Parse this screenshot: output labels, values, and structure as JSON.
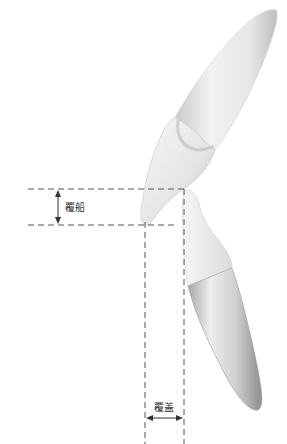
{
  "diagram": {
    "labels": {
      "overbite": "覆船",
      "overjet": "覆盖"
    },
    "colors": {
      "line": "#555555",
      "tooth_light": "#f4f4f4",
      "tooth_mid": "#d6d6d6",
      "tooth_dark": "#9a9a9a",
      "background": "#ffffff"
    },
    "elements": [
      "upper-incisor",
      "lower-incisor",
      "overbite-measure",
      "overjet-measure"
    ]
  }
}
